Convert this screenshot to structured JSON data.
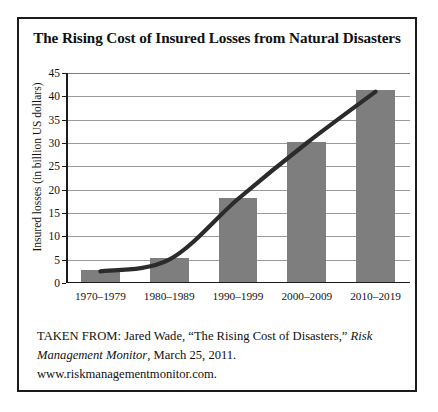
{
  "chart_data": {
    "type": "bar",
    "title": "The Rising Cost of Insured Losses from Natural Disasters",
    "xlabel": "",
    "ylabel": "Insured losses (in billion US dollars)",
    "categories": [
      "1970–1979",
      "1980–1989",
      "1990–1999",
      "2000–2009",
      "2010–2019"
    ],
    "values": [
      2.5,
      5,
      18,
      30,
      41
    ],
    "ylim": [
      0,
      45
    ],
    "ytick_labels": [
      "0",
      "5",
      "10",
      "15",
      "20",
      "25",
      "30",
      "35",
      "40",
      "45"
    ],
    "ytick_values": [
      0,
      5,
      10,
      15,
      20,
      25,
      30,
      35,
      40,
      45
    ],
    "grid": true,
    "legend": "none",
    "series": [
      {
        "name": "Insured losses",
        "type": "bar",
        "values": [
          2.5,
          5,
          18,
          30,
          41
        ]
      },
      {
        "name": "Trend line",
        "type": "line",
        "values": [
          2.5,
          5,
          18,
          30,
          41
        ]
      }
    ],
    "bar_color": "#7e7e7e",
    "trend_line_color": "#2b2b2b",
    "gridline_color": "#9a9a9a",
    "axis_color": "#1b1b1b"
  },
  "citation": {
    "line1_prefix": "TAKEN FROM: Jared Wade, “The Rising Cost of Disasters,” ",
    "publication": "Risk Management Monitor",
    "line2_suffix": ", March 25, 2011.",
    "website": "www.riskmanagementmonitor.com."
  }
}
